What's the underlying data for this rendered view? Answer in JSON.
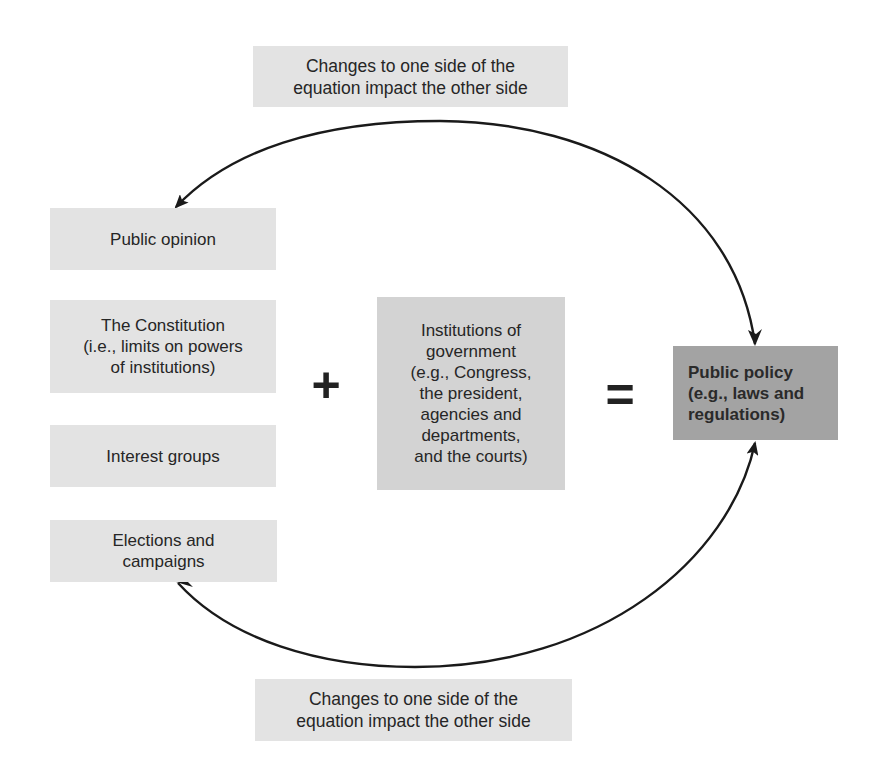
{
  "notes": {
    "top": "Changes to one side of the\nequation impact the other side",
    "bottom": "Changes to one side of the\nequation impact the other side"
  },
  "inputs": [
    {
      "label": "Public opinion"
    },
    {
      "label": "The Constitution\n(i.e., limits on powers\nof institutions)"
    },
    {
      "label": "Interest groups"
    },
    {
      "label": "Elections and\ncampaigns"
    }
  ],
  "operators": {
    "plus": "+",
    "equals": "="
  },
  "institutions": {
    "label": "Institutions of\ngovernment\n(e.g., Congress,\nthe president,\nagencies and\ndepartments,\nand the courts)"
  },
  "output": {
    "label": "Public policy\n(e.g., laws and\nregulations)"
  },
  "colors": {
    "light_box": "#e3e3e3",
    "institutions_box": "#d3d3d3",
    "policy_box": "#a3a3a3",
    "arrow": "#1a1a1a"
  }
}
